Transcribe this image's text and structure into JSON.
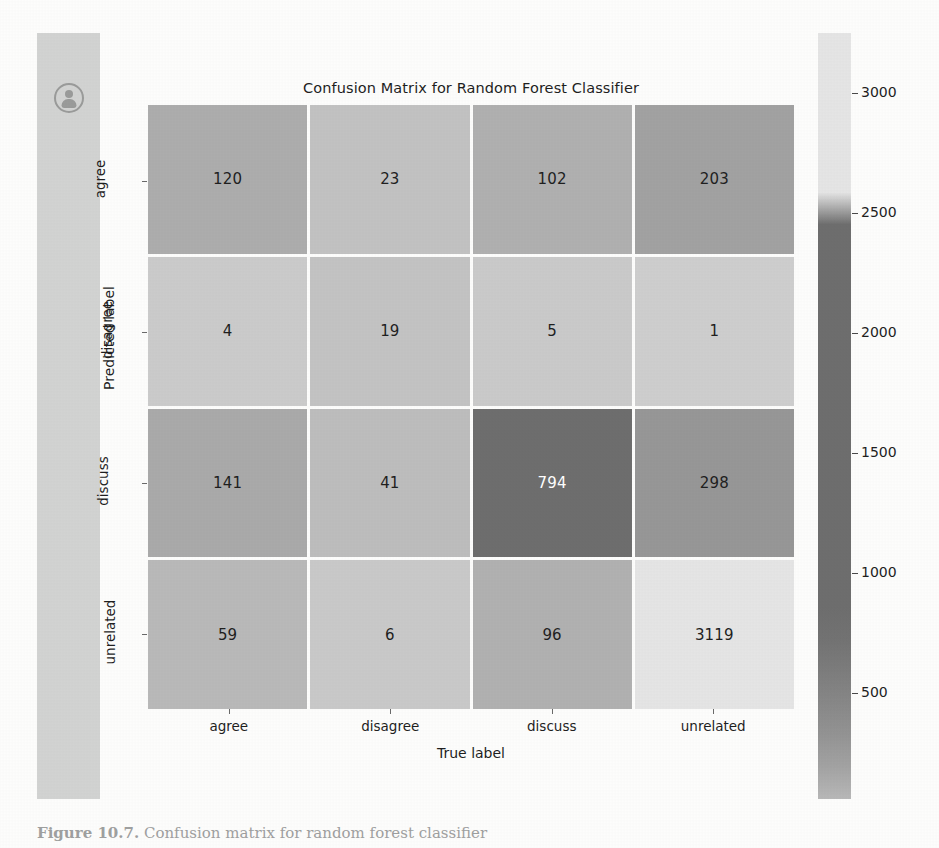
{
  "sidebar": {
    "avatar_icon": "account-person-icon"
  },
  "caption": {
    "figure_number": "Figure 10.7.",
    "text": " Confusion matrix for random forest classifier"
  },
  "colors": {
    "page_background": "#fdfdfc",
    "sidebar": "#d2d3d2",
    "cell_min": "#e7e7e7",
    "cell_max": "#6e6e6e",
    "text_dark": "#1f1f1f",
    "text_light": "#ffffff"
  },
  "chart_data": {
    "type": "heatmap",
    "title": "Confusion Matrix for Random Forest Classifier",
    "xlabel": "True label",
    "ylabel": "Predicted label",
    "x_categories": [
      "agree",
      "disagree",
      "discuss",
      "unrelated"
    ],
    "y_categories": [
      "agree",
      "disagree",
      "discuss",
      "unrelated"
    ],
    "values": [
      [
        120,
        23,
        102,
        203
      ],
      [
        4,
        19,
        5,
        1
      ],
      [
        141,
        41,
        794,
        298
      ],
      [
        59,
        6,
        96,
        3119
      ]
    ],
    "colorbar": {
      "ticks": [
        3000,
        2500,
        2000,
        1500,
        1000,
        500
      ],
      "tick_labels": [
        "3000",
        "2500",
        "2000",
        "1500",
        "1000",
        "500"
      ],
      "position": "right",
      "scale_note": "inverted-grayscale: high values render light, mid values render dark"
    },
    "grid": false,
    "legend": "colorbar"
  }
}
